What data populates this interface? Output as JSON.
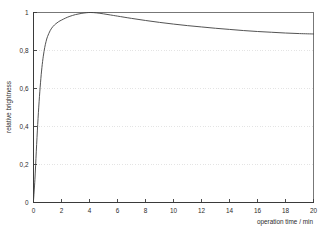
{
  "chart_data": {
    "type": "line",
    "title": "",
    "xlabel": "operation time / min",
    "ylabel": "relative brightness",
    "xlim": [
      0,
      20
    ],
    "ylim": [
      0,
      1
    ],
    "grid": "horizontal-dotted",
    "legend": "none",
    "x_ticks": [
      "0",
      "2",
      "4",
      "6",
      "8",
      "10",
      "12",
      "14",
      "16",
      "18",
      "20"
    ],
    "x_tick_values": [
      0,
      2,
      4,
      6,
      8,
      10,
      12,
      14,
      16,
      18,
      20
    ],
    "y_ticks": [
      "0",
      "0,2",
      "0,4",
      "0,6",
      "0,8",
      "1"
    ],
    "y_tick_values": [
      0,
      0.2,
      0.4,
      0.6,
      0.8,
      1
    ],
    "series": [
      {
        "name": "relative brightness",
        "color": "#3f3f3f",
        "x": [
          0,
          0.1,
          0.2,
          0.3,
          0.4,
          0.5,
          0.6,
          0.7,
          0.8,
          0.9,
          1.0,
          1.2,
          1.4,
          1.6,
          1.8,
          2.0,
          2.3,
          2.6,
          3.0,
          3.4,
          3.8,
          4.1,
          4.5,
          5.0,
          5.5,
          6.0,
          7.0,
          8.0,
          9.0,
          10.0,
          11.0,
          12.0,
          13.0,
          14.0,
          15.0,
          16.0,
          17.0,
          18.0,
          19.0,
          20.0
        ],
        "values": [
          0.01,
          0.12,
          0.27,
          0.41,
          0.53,
          0.63,
          0.71,
          0.77,
          0.815,
          0.848,
          0.873,
          0.906,
          0.927,
          0.941,
          0.952,
          0.96,
          0.971,
          0.98,
          0.989,
          0.995,
          0.999,
          1.0,
          0.998,
          0.993,
          0.987,
          0.981,
          0.969,
          0.958,
          0.948,
          0.939,
          0.931,
          0.924,
          0.917,
          0.911,
          0.905,
          0.9,
          0.896,
          0.892,
          0.889,
          0.887
        ]
      }
    ],
    "annotations": []
  },
  "axes": {
    "x_axis_title": "operation time / min",
    "y_axis_title": "relative brightness"
  },
  "colors": {
    "curve": "#3f3f3f",
    "axis": "#3a3a3a",
    "grid": "#d8d8d8",
    "frame": "#555555",
    "background": "#ffffff",
    "text": "#2b2b2b"
  }
}
